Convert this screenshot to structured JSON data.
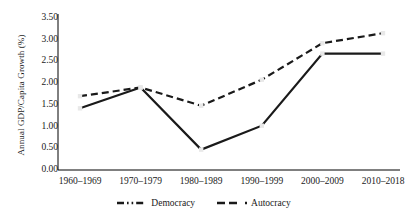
{
  "chart_data": {
    "type": "line",
    "title": "",
    "xlabel": "",
    "ylabel": "Annual GDP/Capita Growth (%)",
    "categories": [
      "1960–1969",
      "1970–1979",
      "1980–1989",
      "1990–1999",
      "2000–2009",
      "2010–2018"
    ],
    "ylim": [
      0.0,
      3.5
    ],
    "yticks": [
      "0.00",
      "0.50",
      "1.00",
      "1.50",
      "2.00",
      "2.50",
      "3.00",
      "3.50"
    ],
    "ytick_values": [
      0.0,
      0.5,
      1.0,
      1.5,
      2.0,
      2.5,
      3.0,
      3.5
    ],
    "grid": false,
    "legend_position": "bottom",
    "series": [
      {
        "name": "Democracy",
        "values": [
          1.7,
          1.9,
          1.48,
          2.08,
          2.92,
          3.15
        ],
        "style": "dashed",
        "color": "#1a1a1a"
      },
      {
        "name": "Autocracy",
        "values": [
          1.42,
          1.9,
          0.47,
          1.02,
          2.68,
          2.68
        ],
        "style": "solid",
        "color": "#1a1a1a"
      }
    ]
  },
  "legend": {
    "items": [
      {
        "label": "Democracy",
        "marker": "dash-dot-line-icon"
      },
      {
        "label": "Autocracy",
        "marker": "dashed-line-icon"
      }
    ]
  },
  "colors": {
    "axis": "#000000",
    "line": "#1a1a1a",
    "marker_fill": "#e8e8e8",
    "background": "#ffffff"
  }
}
